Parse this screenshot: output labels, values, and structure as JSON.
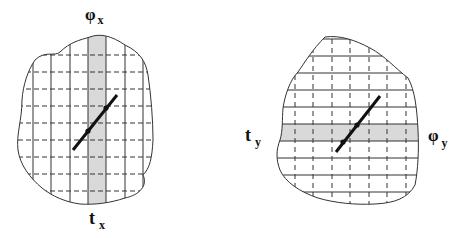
{
  "figures": [
    {
      "id": "left",
      "label_top": "φ",
      "label_top_sub": "x",
      "label_bottom": "t",
      "label_bottom_sub": "x",
      "shaded_band": "vertical column",
      "grid_solid": "vertical",
      "grid_dashed": "horizontal"
    },
    {
      "id": "right",
      "label_left": "t",
      "label_left_sub": "y",
      "label_right": "φ",
      "label_right_sub": "y",
      "shaded_band": "horizontal row",
      "grid_solid": "horizontal",
      "grid_dashed": "vertical"
    }
  ],
  "colors": {
    "outline": "#333333",
    "shade": "#d9d9d9",
    "line": "#111111"
  }
}
